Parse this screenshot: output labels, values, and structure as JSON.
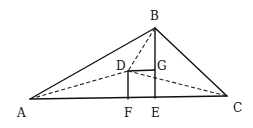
{
  "figure": {
    "type": "geometric-diagram",
    "points": {
      "A": {
        "x": 30,
        "y": 99
      },
      "B": {
        "x": 155,
        "y": 28
      },
      "C": {
        "x": 227,
        "y": 96
      },
      "D": {
        "x": 128,
        "y": 71
      },
      "E": {
        "x": 155,
        "y": 98
      },
      "F": {
        "x": 128,
        "y": 99
      },
      "G": {
        "x": 155,
        "y": 70
      }
    },
    "labels": {
      "A": "A",
      "B": "B",
      "C": "C",
      "D": "D",
      "E": "E",
      "F": "F",
      "G": "G"
    },
    "solid_segments": [
      [
        "A",
        "B"
      ],
      [
        "B",
        "C"
      ],
      [
        "A",
        "C"
      ],
      [
        "B",
        "E"
      ],
      [
        "D",
        "F"
      ],
      [
        "D",
        "G"
      ]
    ],
    "dashed_segments": [
      [
        "A",
        "D"
      ],
      [
        "D",
        "C"
      ],
      [
        "B",
        "D"
      ]
    ]
  }
}
